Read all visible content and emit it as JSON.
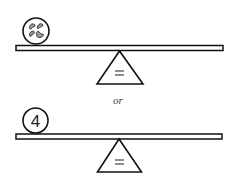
{
  "diagram": {
    "type": "balance-scale-equivalence",
    "scales": [
      {
        "id": "top",
        "left_item": {
          "type": "circle-with-beans",
          "count": 4,
          "icon": "beans-icon"
        },
        "fulcrum_symbol": "="
      },
      {
        "id": "bottom",
        "left_item": {
          "type": "circle-with-number",
          "label": "4"
        },
        "fulcrum_symbol": "="
      }
    ],
    "connector": "or"
  }
}
